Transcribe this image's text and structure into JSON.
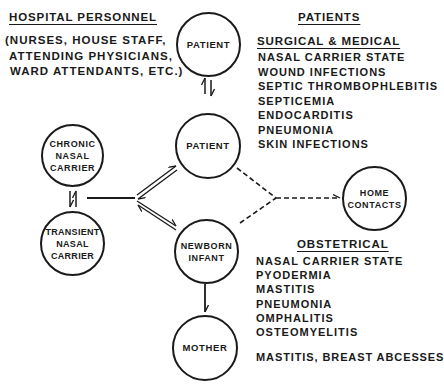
{
  "left_header": {
    "title": "HOSPITAL PERSONNEL",
    "lines": [
      "(NURSES, HOUSE STAFF,",
      "ATTENDING PHYSICIANS,",
      "WARD ATTENDANTS, ETC.)"
    ]
  },
  "right_header": {
    "title": "PATIENTS"
  },
  "surgical_medical": {
    "title": "SURGICAL & MEDICAL",
    "items": [
      "NASAL CARRIER STATE",
      "WOUND INFECTIONS",
      "SEPTIC THROMBOPHLEBITIS",
      "SEPTICEMIA",
      "ENDOCARDITIS",
      "PNEUMONIA",
      "SKIN INFECTIONS"
    ]
  },
  "obstetrical": {
    "title": "OBSTETRICAL",
    "items": [
      "NASAL CARRIER STATE",
      "PYODERMIA",
      "MASTITIS",
      "PNEUMONIA",
      "OMPHALITIS",
      "OSTEOMYELITIS"
    ],
    "mother_note": "MASTITIS, BREAST ABCESSES"
  },
  "nodes": {
    "patient_top": [
      "PATIENT"
    ],
    "patient_mid": [
      "PATIENT"
    ],
    "chronic": [
      "CHRONIC",
      "NASAL",
      "CARRIER"
    ],
    "transient": [
      "TRANSIENT",
      "NASAL",
      "CARRIER"
    ],
    "newborn": [
      "NEWBORN",
      "INFANT"
    ],
    "mother": [
      "MOTHER"
    ],
    "home": [
      "HOME",
      "CONTACTS"
    ]
  },
  "colors": {
    "ink": "#1a1a1a",
    "background": "#ffffff"
  }
}
